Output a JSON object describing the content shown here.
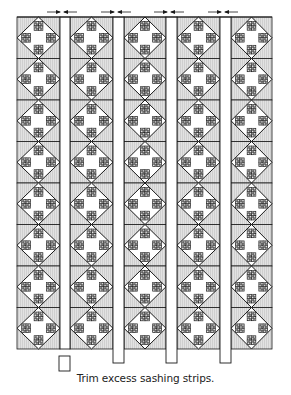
{
  "figure": {
    "caption": "Trim excess sashing strips.",
    "colors": {
      "background": "#ffffff",
      "stroke": "#1a1a1a",
      "block_background": "#dcdcdc",
      "block_stripe": "#cfcfcf",
      "diamond_fill": "#ffffff",
      "sashing_fill": "#ffffff",
      "patch_light": "#e6e6e6",
      "patch_dark": "#8a8a8a"
    },
    "quilt": {
      "left": 17,
      "top": 17,
      "right": 272,
      "bottom": 349,
      "columns": [
        {
          "x0": 17,
          "x1": 60
        },
        {
          "x0": 70,
          "x1": 113
        },
        {
          "x0": 124,
          "x1": 166
        },
        {
          "x0": 177,
          "x1": 220
        },
        {
          "x0": 231,
          "x1": 272
        }
      ],
      "rows": 8,
      "block_description": "Diamond-in-square block with four 2x2 patch units at north, south, east, west"
    },
    "sashing_strips": [
      {
        "x0": 60,
        "x1": 70,
        "bottom": 349
      },
      {
        "x0": 113,
        "x1": 124,
        "bottom": 363
      },
      {
        "x0": 166,
        "x1": 177,
        "bottom": 363
      },
      {
        "x0": 220,
        "x1": 231,
        "bottom": 363
      }
    ],
    "trimmed_piece": {
      "x": 59,
      "y": 356,
      "w": 11,
      "h": 15
    },
    "arrows": [
      {
        "center": 62,
        "y": 12
      },
      {
        "center": 116,
        "y": 12
      },
      {
        "center": 169,
        "y": 12
      },
      {
        "center": 223,
        "y": 12
      }
    ]
  }
}
